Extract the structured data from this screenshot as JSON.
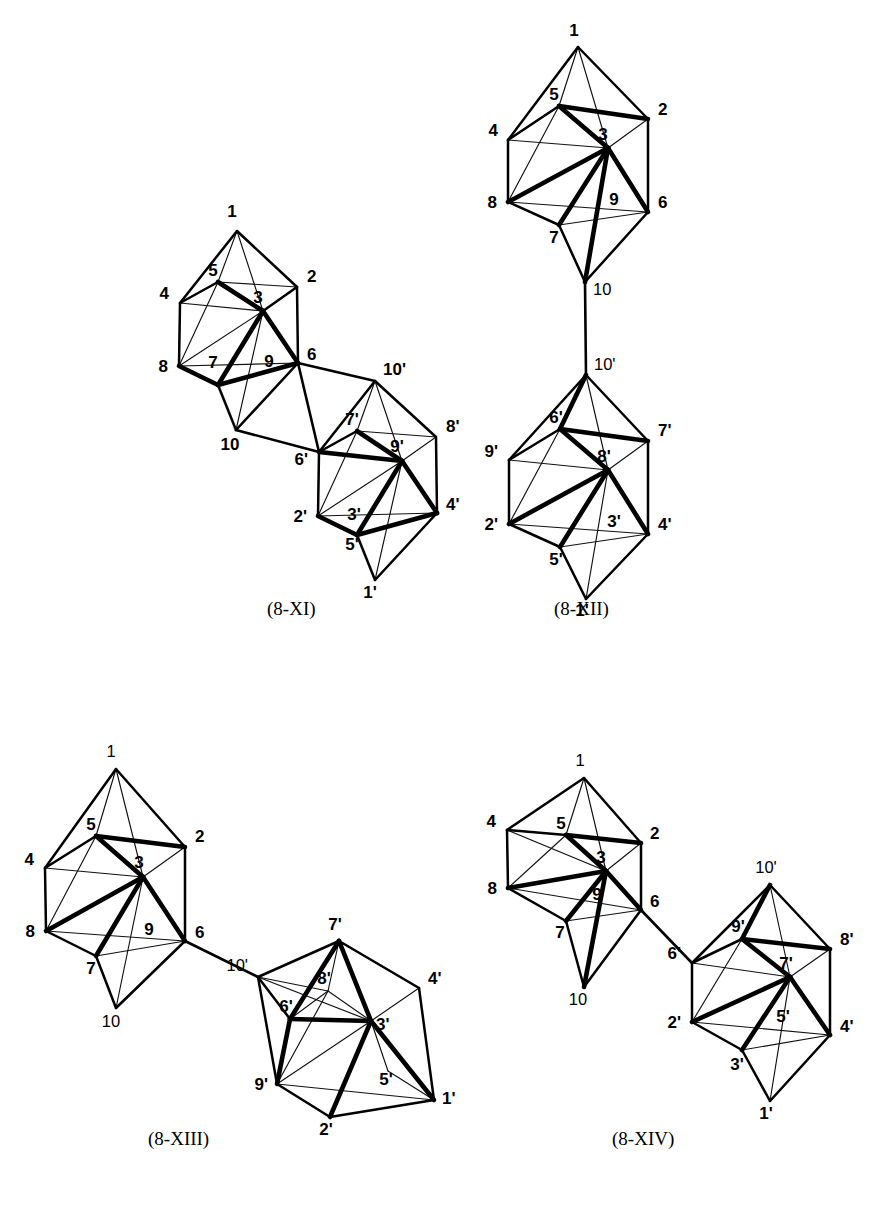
{
  "page": {
    "width": 885,
    "height": 1221,
    "background": "#ffffff",
    "ink": "#000000"
  },
  "figures": [
    {
      "id": "fig-8-XI",
      "caption": "(8-XI)",
      "caption_pos": {
        "x": 267,
        "y": 610
      },
      "description": "Two fused 10-vertex bicapped square antiprism clusters sharing a 6-6' / 10-6' linkage",
      "clusters": [
        {
          "id": "cluster-unprimed",
          "vertices": [
            {
              "label": "1",
              "x": 237,
              "y": 231,
              "lx": 232,
              "ly": 217,
              "anchor": "middle"
            },
            {
              "label": "5",
              "x": 218,
              "y": 282,
              "lx": 213,
              "ly": 276,
              "anchor": "middle"
            },
            {
              "label": "2",
              "x": 297,
              "y": 287,
              "lx": 307,
              "ly": 282,
              "anchor": "start"
            },
            {
              "label": "3",
              "x": 263,
              "y": 311,
              "lx": 258,
              "ly": 303,
              "anchor": "middle"
            },
            {
              "label": "4",
              "x": 180,
              "y": 303,
              "lx": 169,
              "ly": 299,
              "anchor": "end"
            },
            {
              "label": "9",
              "x": 263,
              "y": 311,
              "lx": 269,
              "ly": 367,
              "anchor": "middle"
            },
            {
              "label": "8",
              "x": 179,
              "y": 366,
              "lx": 168,
              "ly": 372,
              "anchor": "end"
            },
            {
              "label": "7",
              "x": 218,
              "y": 385,
              "lx": 213,
              "ly": 368,
              "anchor": "middle"
            },
            {
              "label": "6",
              "x": 298,
              "y": 363,
              "lx": 307,
              "ly": 360,
              "anchor": "start"
            },
            {
              "label": "10",
              "x": 236,
              "y": 430,
              "lx": 230,
              "ly": 450,
              "anchor": "middle"
            }
          ]
        },
        {
          "id": "cluster-primed",
          "vertices": [
            {
              "label": "10'",
              "x": 375,
              "y": 381,
              "lx": 383,
              "ly": 375,
              "anchor": "start"
            },
            {
              "label": "7'",
              "x": 357,
              "y": 431,
              "lx": 352,
              "ly": 425,
              "anchor": "middle"
            },
            {
              "label": "8'",
              "x": 436,
              "y": 437,
              "lx": 446,
              "ly": 432,
              "anchor": "start"
            },
            {
              "label": "9'",
              "x": 402,
              "y": 461,
              "lx": 397,
              "ly": 452,
              "anchor": "middle"
            },
            {
              "label": "6'",
              "x": 319,
              "y": 452,
              "lx": 308,
              "ly": 465,
              "anchor": "end"
            },
            {
              "label": "3'",
              "x": 402,
              "y": 461,
              "lx": 354,
              "ly": 520,
              "anchor": "middle"
            },
            {
              "label": "2'",
              "x": 318,
              "y": 516,
              "lx": 307,
              "ly": 522,
              "anchor": "end"
            },
            {
              "label": "5'",
              "x": 357,
              "y": 535,
              "lx": 352,
              "ly": 550,
              "anchor": "middle"
            },
            {
              "label": "4'",
              "x": 437,
              "y": 513,
              "lx": 446,
              "ly": 510,
              "anchor": "start"
            },
            {
              "label": "1'",
              "x": 375,
              "y": 580,
              "lx": 370,
              "ly": 598,
              "anchor": "middle"
            }
          ]
        }
      ]
    },
    {
      "id": "fig-8-XII",
      "caption": "(8-XII)",
      "caption_pos": {
        "x": 554,
        "y": 610
      },
      "description": "Two 10-vertex clusters joined vertically by a single 10-10' bond",
      "clusters": [
        {
          "id": "cluster-unprimed",
          "vertices": [
            {
              "label": "1",
              "x": 578,
              "y": 47,
              "lx": 574,
              "ly": 36,
              "anchor": "middle"
            },
            {
              "label": "5",
              "x": 559,
              "y": 106,
              "lx": 554,
              "ly": 100,
              "anchor": "middle"
            },
            {
              "label": "2",
              "x": 648,
              "y": 119,
              "lx": 658,
              "ly": 115,
              "anchor": "start"
            },
            {
              "label": "3",
              "x": 608,
              "y": 148,
              "lx": 603,
              "ly": 140,
              "anchor": "middle"
            },
            {
              "label": "4",
              "x": 508,
              "y": 140,
              "lx": 498,
              "ly": 136,
              "anchor": "end"
            },
            {
              "label": "9",
              "x": 608,
              "y": 148,
              "lx": 614,
              "ly": 205,
              "anchor": "middle"
            },
            {
              "label": "8",
              "x": 508,
              "y": 202,
              "lx": 497,
              "ly": 208,
              "anchor": "end"
            },
            {
              "label": "7",
              "x": 559,
              "y": 225,
              "lx": 554,
              "ly": 243,
              "anchor": "middle"
            },
            {
              "label": "6",
              "x": 648,
              "y": 212,
              "lx": 658,
              "ly": 208,
              "anchor": "start"
            },
            {
              "label": "10",
              "x": 585,
              "y": 282,
              "lx": 593,
              "ly": 295,
              "anchor": "start"
            }
          ]
        },
        {
          "id": "cluster-primed",
          "vertices": [
            {
              "label": "10'",
              "x": 586,
              "y": 375,
              "lx": 594,
              "ly": 370,
              "anchor": "start"
            },
            {
              "label": "6'",
              "x": 560,
              "y": 429,
              "lx": 556,
              "ly": 423,
              "anchor": "middle"
            },
            {
              "label": "7'",
              "x": 648,
              "y": 441,
              "lx": 658,
              "ly": 436,
              "anchor": "start"
            },
            {
              "label": "8'",
              "x": 608,
              "y": 470,
              "lx": 604,
              "ly": 462,
              "anchor": "middle"
            },
            {
              "label": "9'",
              "x": 509,
              "y": 460,
              "lx": 498,
              "ly": 457,
              "anchor": "end"
            },
            {
              "label": "3'",
              "x": 608,
              "y": 470,
              "lx": 614,
              "ly": 527,
              "anchor": "middle"
            },
            {
              "label": "2'",
              "x": 509,
              "y": 524,
              "lx": 498,
              "ly": 530,
              "anchor": "end"
            },
            {
              "label": "5'",
              "x": 560,
              "y": 547,
              "lx": 556,
              "ly": 565,
              "anchor": "middle"
            },
            {
              "label": "4'",
              "x": 648,
              "y": 534,
              "lx": 658,
              "ly": 530,
              "anchor": "start"
            },
            {
              "label": "1'",
              "x": 586,
              "y": 599,
              "lx": 582,
              "ly": 616,
              "anchor": "middle"
            }
          ]
        }
      ]
    },
    {
      "id": "fig-8-XIII",
      "caption": "(8-XIII)",
      "caption_pos": {
        "x": 148,
        "y": 1140
      },
      "description": "Two 10-vertex clusters joined by a 6-10' bond; right cluster rotated onto its side",
      "clusters": [
        {
          "id": "cluster-unprimed",
          "vertices": [
            {
              "label": "1",
              "x": 116,
              "y": 769,
              "lx": 111,
              "ly": 757,
              "anchor": "middle"
            },
            {
              "label": "5",
              "x": 96,
              "y": 836,
              "lx": 91,
              "ly": 830,
              "anchor": "middle"
            },
            {
              "label": "2",
              "x": 185,
              "y": 847,
              "lx": 195,
              "ly": 842,
              "anchor": "start"
            },
            {
              "label": "3",
              "x": 143,
              "y": 877,
              "lx": 139,
              "ly": 868,
              "anchor": "middle"
            },
            {
              "label": "4",
              "x": 45,
              "y": 868,
              "lx": 34,
              "ly": 865,
              "anchor": "end"
            },
            {
              "label": "9",
              "x": 143,
              "y": 877,
              "lx": 149,
              "ly": 935,
              "anchor": "middle"
            },
            {
              "label": "8",
              "x": 46,
              "y": 931,
              "lx": 35,
              "ly": 937,
              "anchor": "end"
            },
            {
              "label": "7",
              "x": 96,
              "y": 956,
              "lx": 91,
              "ly": 974,
              "anchor": "middle"
            },
            {
              "label": "6",
              "x": 185,
              "y": 941,
              "lx": 195,
              "ly": 938,
              "anchor": "start"
            },
            {
              "label": "10",
              "x": 116,
              "y": 1008,
              "lx": 111,
              "ly": 1027,
              "anchor": "middle"
            }
          ]
        },
        {
          "id": "cluster-primed",
          "vertices": [
            {
              "label": "10'",
              "x": 258,
              "y": 977,
              "lx": 248,
              "ly": 971,
              "anchor": "end"
            },
            {
              "label": "7'",
              "x": 339,
              "y": 941,
              "lx": 335,
              "ly": 930,
              "anchor": "middle"
            },
            {
              "label": "8'",
              "x": 328,
              "y": 991,
              "lx": 324,
              "ly": 984,
              "anchor": "middle"
            },
            {
              "label": "4'",
              "x": 419,
              "y": 988,
              "lx": 428,
              "ly": 984,
              "anchor": "start"
            },
            {
              "label": "6'",
              "x": 290,
              "y": 1019,
              "lx": 286,
              "ly": 1012,
              "anchor": "middle"
            },
            {
              "label": "3'",
              "x": 371,
              "y": 1021,
              "lx": 376,
              "ly": 1030,
              "anchor": "start"
            },
            {
              "label": "9'",
              "x": 277,
              "y": 1084,
              "lx": 268,
              "ly": 1090,
              "anchor": "end"
            },
            {
              "label": "5'",
              "x": 388,
              "y": 1071,
              "lx": 386,
              "ly": 1085,
              "anchor": "middle"
            },
            {
              "label": "2'",
              "x": 330,
              "y": 1117,
              "lx": 326,
              "ly": 1135,
              "anchor": "middle"
            },
            {
              "label": "1'",
              "x": 434,
              "y": 1100,
              "lx": 442,
              "ly": 1104,
              "anchor": "start"
            }
          ]
        }
      ]
    },
    {
      "id": "fig-8-XIV",
      "caption": "(8-XIV)",
      "caption_pos": {
        "x": 612,
        "y": 1140
      },
      "description": "Two 10-vertex clusters joined by a 6-6' bond",
      "clusters": [
        {
          "id": "cluster-unprimed",
          "vertices": [
            {
              "label": "1",
              "x": 584,
              "y": 778,
              "lx": 580,
              "ly": 766,
              "anchor": "middle"
            },
            {
              "label": "5",
              "x": 566,
              "y": 835,
              "lx": 561,
              "ly": 829,
              "anchor": "middle"
            },
            {
              "label": "2",
              "x": 641,
              "y": 843,
              "lx": 650,
              "ly": 839,
              "anchor": "start"
            },
            {
              "label": "3",
              "x": 606,
              "y": 871,
              "lx": 601,
              "ly": 863,
              "anchor": "middle"
            },
            {
              "label": "4",
              "x": 507,
              "y": 830,
              "lx": 496,
              "ly": 827,
              "anchor": "end"
            },
            {
              "label": "9",
              "x": 606,
              "y": 871,
              "lx": 597,
              "ly": 900,
              "anchor": "middle"
            },
            {
              "label": "8",
              "x": 508,
              "y": 888,
              "lx": 497,
              "ly": 894,
              "anchor": "end"
            },
            {
              "label": "7",
              "x": 566,
              "y": 921,
              "lx": 560,
              "ly": 938,
              "anchor": "middle"
            },
            {
              "label": "6",
              "x": 641,
              "y": 910,
              "lx": 650,
              "ly": 907,
              "anchor": "start"
            },
            {
              "label": "10",
              "x": 584,
              "y": 987,
              "lx": 578,
              "ly": 1005,
              "anchor": "middle"
            }
          ]
        },
        {
          "id": "cluster-primed",
          "vertices": [
            {
              "label": "10'",
              "x": 770,
              "y": 885,
              "lx": 766,
              "ly": 873,
              "anchor": "middle"
            },
            {
              "label": "9'",
              "x": 742,
              "y": 939,
              "lx": 738,
              "ly": 932,
              "anchor": "middle"
            },
            {
              "label": "8'",
              "x": 830,
              "y": 949,
              "lx": 840,
              "ly": 945,
              "anchor": "start"
            },
            {
              "label": "7'",
              "x": 790,
              "y": 977,
              "lx": 786,
              "ly": 969,
              "anchor": "middle"
            },
            {
              "label": "6'",
              "x": 692,
              "y": 963,
              "lx": 681,
              "ly": 959,
              "anchor": "end"
            },
            {
              "label": "5'",
              "x": 790,
              "y": 977,
              "lx": 783,
              "ly": 1022,
              "anchor": "middle"
            },
            {
              "label": "2'",
              "x": 692,
              "y": 1022,
              "lx": 681,
              "ly": 1028,
              "anchor": "end"
            },
            {
              "label": "3'",
              "x": 742,
              "y": 1050,
              "lx": 737,
              "ly": 1070,
              "anchor": "middle"
            },
            {
              "label": "4'",
              "x": 830,
              "y": 1035,
              "lx": 840,
              "ly": 1032,
              "anchor": "start"
            },
            {
              "label": "1'",
              "x": 770,
              "y": 1101,
              "lx": 766,
              "ly": 1119,
              "anchor": "middle"
            }
          ]
        }
      ]
    }
  ],
  "geometry_note": {
    "polyhedron": "bicapped square antiprism",
    "vertex_count_per_cluster": 10,
    "clusters_per_figure": 2
  }
}
